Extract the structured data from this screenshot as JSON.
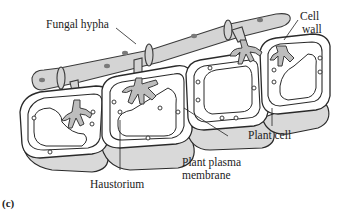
{
  "figure": {
    "panel_label": "(c)",
    "labels": {
      "fungal_hypha": "Fungal hypha",
      "cell_wall_line1": "Cell",
      "cell_wall_line2": "wall",
      "plant_cell": "Plant cell",
      "plant_plasma_membrane_line1": "Plant plasma",
      "plant_plasma_membrane_line2": "membrane",
      "haustorium": "Haustorium"
    },
    "structures": [
      "fungal-hypha",
      "septum",
      "haustorium",
      "plant-cell",
      "cell-wall",
      "plant-plasma-membrane",
      "vacuole"
    ],
    "colors": {
      "hypha_fill": "#d4d4d4",
      "haustorium_fill": "#bdbdbd",
      "outline": "#2a2a2a",
      "background": "#ffffff"
    }
  }
}
